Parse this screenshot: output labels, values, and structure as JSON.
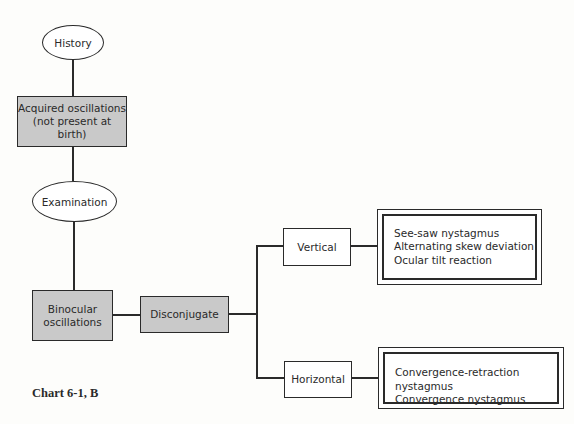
{
  "diagram": {
    "type": "flowchart",
    "nodes": {
      "history": "History",
      "acquired_line1": "Acquired oscillations",
      "acquired_line2": "(not present at birth)",
      "examination": "Examination",
      "binocular_line1": "Binocular",
      "binocular_line2": "oscillations",
      "disconjugate": "Disconjugate",
      "vertical": "Vertical",
      "horizontal": "Horizontal"
    },
    "vertical_outcomes": [
      "See-saw nystagmus",
      "Alternating skew deviation",
      "Ocular tilt reaction"
    ],
    "horizontal_outcomes": [
      "Convergence-retraction nystagmus",
      "Convergence nystagmus"
    ],
    "caption": "Chart 6-1, B",
    "colors": {
      "shaded_box": "#c9c9c9",
      "line": "#2a2a2a"
    }
  }
}
